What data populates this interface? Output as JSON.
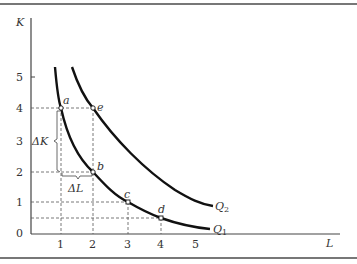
{
  "diagram": {
    "type": "isoquant",
    "axes": {
      "y_label": "K",
      "x_label": "L"
    },
    "x_ticks": [
      "1",
      "2",
      "3",
      "4",
      "5"
    ],
    "y_ticks": [
      "0",
      "1",
      "2",
      "3",
      "4",
      "5"
    ],
    "points": {
      "a": "a",
      "b": "b",
      "c": "c",
      "d": "d",
      "e": "e"
    },
    "deltas": {
      "dK": "ΔK",
      "dL": "ΔL"
    },
    "curves": {
      "q1": "Q",
      "q1_sub": "1",
      "q2": "Q",
      "q2_sub": "2"
    }
  }
}
